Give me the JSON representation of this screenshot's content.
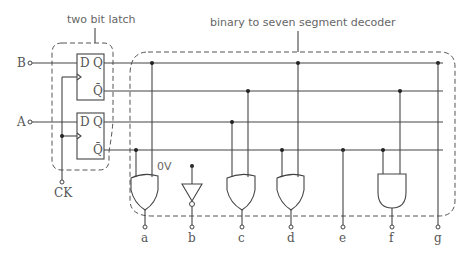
{
  "diagram": {
    "title_latch": "two bit latch",
    "title_decoder": "binary to seven segment decoder",
    "inputs": {
      "b": "B",
      "a": "A",
      "clock": "CK"
    },
    "flipflop_pins": {
      "d": "D",
      "q": "Q",
      "qbar": "Q̄"
    },
    "zero_volt_label": "0V",
    "outputs": [
      "a",
      "b",
      "c",
      "d",
      "e",
      "f",
      "g"
    ],
    "gates": [
      {
        "output": "a",
        "type": "OR"
      },
      {
        "output": "b",
        "type": "NOT"
      },
      {
        "output": "c",
        "type": "OR"
      },
      {
        "output": "d",
        "type": "OR"
      },
      {
        "output": "e",
        "type": "WIRE"
      },
      {
        "output": "f",
        "type": "AND"
      },
      {
        "output": "g",
        "type": "WIRE"
      }
    ],
    "colors": {
      "line": "#444444",
      "text": "#555555",
      "background": "#ffffff"
    }
  }
}
